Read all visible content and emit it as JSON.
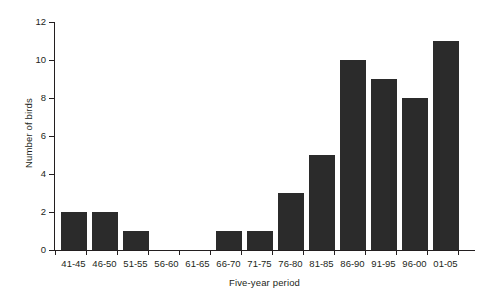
{
  "chart_data": {
    "type": "bar",
    "title": "",
    "subtitle": "",
    "xlabel": "Five-year period",
    "ylabel": "Number of birds",
    "categories": [
      "41-45",
      "46-50",
      "51-55",
      "56-60",
      "61-65",
      "66-70",
      "71-75",
      "76-80",
      "81-85",
      "86-90",
      "91-95",
      "96-00",
      "01-05"
    ],
    "values": [
      2,
      2,
      1,
      0,
      0,
      1,
      1,
      3,
      5,
      10,
      9,
      8,
      11
    ],
    "ylim": [
      0,
      12
    ],
    "ytick_labels": [
      "0",
      "2",
      "4",
      "6",
      "8",
      "10",
      "12"
    ],
    "ytick_values": [
      0,
      2,
      4,
      6,
      8,
      10,
      12
    ],
    "grid": false,
    "legend": false,
    "legend_position": "none",
    "bar_color": "#2b2b2b",
    "axis_color": "#231f20",
    "background_color": "#ffffff"
  }
}
